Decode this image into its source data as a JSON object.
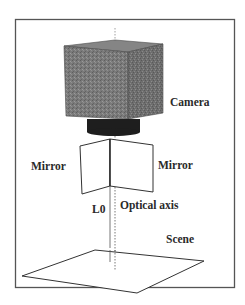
{
  "figure": {
    "labels": {
      "camera": "Camera",
      "mirror_left": "Mirror",
      "mirror_right": "Mirror",
      "l0": "L0",
      "optical_axis": "Optical axis",
      "scene": "Scene"
    },
    "components": [
      "camera",
      "lens",
      "left-mirror",
      "right-mirror",
      "optical-axis",
      "L0-line",
      "scene-plane"
    ],
    "colors": {
      "frame": "#555555",
      "camera_body": "#7a7a7a",
      "camera_right_face": "#6e6e6e",
      "camera_top_face": "#858585",
      "lens": "#1e1e1e",
      "line": "#333333",
      "background": "#ffffff"
    }
  }
}
